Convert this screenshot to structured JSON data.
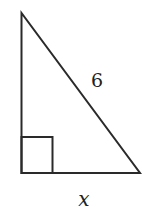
{
  "diagram": {
    "type": "right-triangle",
    "labels": {
      "hypotenuse": "6",
      "base": "x"
    },
    "right_angle_marker": true,
    "stroke_color": "#2a2a2a"
  }
}
